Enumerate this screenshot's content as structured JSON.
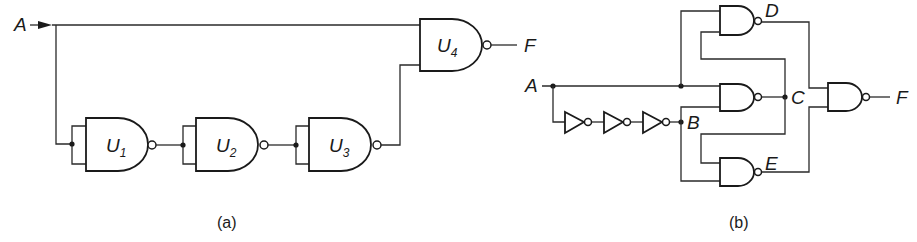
{
  "figure": {
    "panel_a": {
      "caption": "(a)",
      "input_label": "A",
      "output_label": "F",
      "gates": [
        {
          "id": "U1",
          "name": "U",
          "sub": "1",
          "type": "NAND",
          "inputs_tied": true
        },
        {
          "id": "U2",
          "name": "U",
          "sub": "2",
          "type": "NAND",
          "inputs_tied": true
        },
        {
          "id": "U3",
          "name": "U",
          "sub": "3",
          "type": "NAND",
          "inputs_tied": true
        },
        {
          "id": "U4",
          "name": "U",
          "sub": "4",
          "type": "NAND",
          "inputs_tied": false
        }
      ]
    },
    "panel_b": {
      "caption": "(b)",
      "input_label": "A",
      "output_label": "F",
      "node_labels": {
        "B": "B",
        "C": "C",
        "D": "D",
        "E": "E"
      },
      "inverters": 3,
      "nand_gates": [
        "D",
        "C",
        "E",
        "F"
      ]
    }
  },
  "colors": {
    "ink": "#1a1a1a",
    "background": "#ffffff"
  }
}
